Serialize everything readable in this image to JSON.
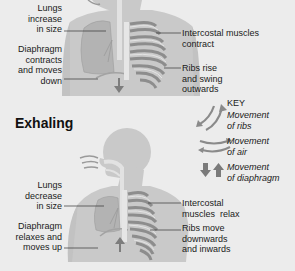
{
  "inhaling": {
    "labels": {
      "lungs": "Lungs increase in size",
      "lungs_lines": [
        "Lungs",
        "increase",
        "in size"
      ],
      "diaphragm_lines": [
        "Diaphragm",
        "contracts",
        "and moves",
        "down"
      ],
      "intercostal_lines": [
        "Intercostal muscles",
        "contract"
      ],
      "ribs_lines": [
        "Ribs rise",
        "and swing",
        "outwards"
      ]
    }
  },
  "exhaling": {
    "heading": "Exhaling",
    "labels": {
      "lungs_lines": [
        "Lungs",
        "decrease",
        "in size"
      ],
      "diaphragm_lines": [
        "Diaphragm",
        "relaxes and",
        "moves up"
      ],
      "intercostal_lines": [
        "Intercostal",
        "muscles  relax"
      ],
      "ribs_lines": [
        "Ribs move",
        "downwards",
        "and inwards"
      ]
    }
  },
  "key": {
    "title": "KEY",
    "items": [
      {
        "icon": "curved-arrows-ribs-icon",
        "lines": [
          "Movement",
          "of ribs"
        ]
      },
      {
        "icon": "curved-arrows-air-icon",
        "lines": [
          "Movement",
          "of air"
        ]
      },
      {
        "icon": "up-down-arrows-diaphragm-icon",
        "lines": [
          "Movement",
          "of diaphragm"
        ]
      }
    ]
  },
  "colors": {
    "background": "#ececec",
    "body": "#c9c9c9",
    "lung": "#b3b3b3",
    "ribs": "#8d8d8d",
    "arrow": "#7d7d7d",
    "text": "#1a1a1a"
  }
}
